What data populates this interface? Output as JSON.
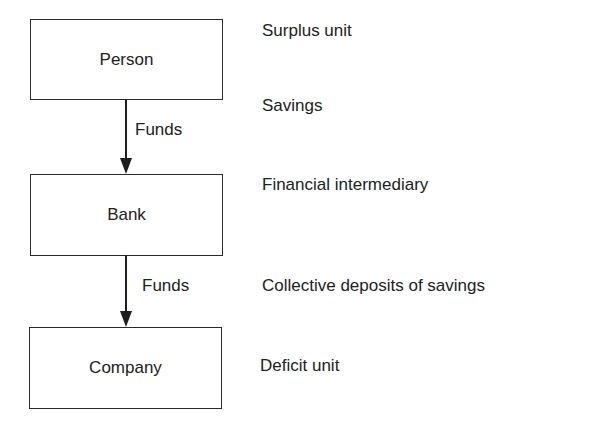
{
  "diagram": {
    "nodes": [
      {
        "id": "person",
        "label": "Person",
        "description": "Surplus unit"
      },
      {
        "id": "bank",
        "label": "Bank",
        "description": "Financial intermediary"
      },
      {
        "id": "company",
        "label": "Company",
        "description": "Deficit unit"
      }
    ],
    "edges": [
      {
        "from": "person",
        "to": "bank",
        "label": "Funds",
        "description": "Savings"
      },
      {
        "from": "bank",
        "to": "company",
        "label": "Funds",
        "description": "Collective deposits of savings"
      }
    ]
  }
}
